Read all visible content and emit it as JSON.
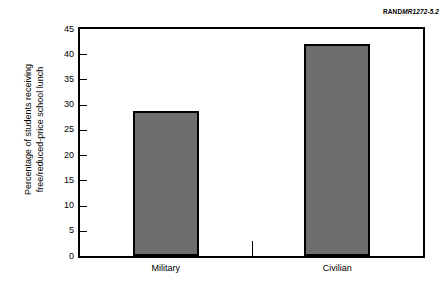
{
  "credit": {
    "brand": "RAND",
    "document_id": "MR1272-5.2"
  },
  "axis": {
    "y_title_line1": "Percentage of students receiving",
    "y_title_line2": "free/reduced-price school lunch"
  },
  "chart_data": {
    "type": "bar",
    "title": "",
    "subtitle": "",
    "xlabel": "",
    "ylabel": "Percentage of students receiving free/reduced-price school lunch",
    "categories": [
      "Military",
      "Civilian"
    ],
    "values": [
      28.8,
      42.0
    ],
    "ylim": [
      0,
      45
    ],
    "ytick_values": [
      0,
      5,
      10,
      15,
      20,
      25,
      30,
      35,
      40,
      45
    ],
    "ytick_labels": [
      "0",
      "5",
      "10",
      "15",
      "20",
      "25",
      "30",
      "35",
      "40",
      "45"
    ],
    "grid": false,
    "legend": false,
    "legend_position": "none",
    "bar_fill_color": "#6e6e6e",
    "bar_edge_color": "#000000",
    "annotations": []
  }
}
